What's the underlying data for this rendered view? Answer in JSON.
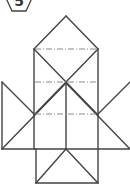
{
  "badge": {
    "label": "5",
    "shape": "hexagon"
  },
  "colors": {
    "line": "#444444",
    "dash": "#888888",
    "background": "#ffffff"
  },
  "figure": {
    "solid_lines": [
      [
        34,
        49,
        66,
        16
      ],
      [
        66,
        16,
        98,
        49
      ],
      [
        34,
        49,
        34,
        149
      ],
      [
        98,
        49,
        98,
        149
      ],
      [
        34,
        49,
        98,
        115
      ],
      [
        98,
        49,
        34,
        115
      ],
      [
        2,
        82,
        2,
        149
      ],
      [
        2,
        82,
        34,
        114
      ],
      [
        2,
        149,
        66,
        83
      ],
      [
        66,
        83,
        130,
        149
      ],
      [
        98,
        114,
        130,
        82
      ],
      [
        2,
        149,
        130,
        149
      ],
      [
        66,
        83,
        66,
        149
      ],
      [
        36,
        149,
        36,
        183
      ],
      [
        98,
        149,
        98,
        183
      ],
      [
        36,
        183,
        98,
        183
      ],
      [
        36,
        183,
        66,
        149
      ],
      [
        66,
        149,
        98,
        183
      ]
    ],
    "dashed_lines": [
      [
        35,
        49,
        97,
        49
      ],
      [
        35,
        82,
        97,
        82
      ],
      [
        35,
        114,
        97,
        114
      ]
    ]
  }
}
